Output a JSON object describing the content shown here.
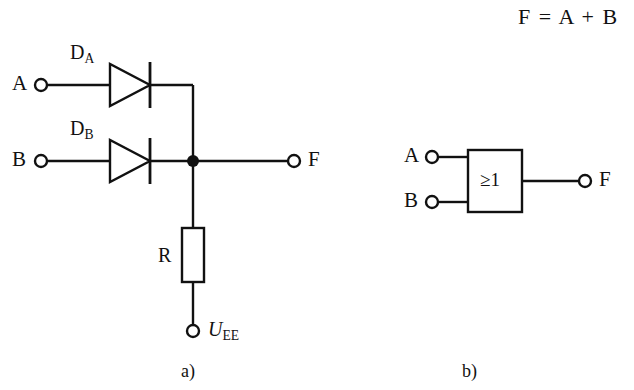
{
  "figure": {
    "equation": "F = A + B",
    "panel_a": {
      "caption": "a)",
      "inputs": [
        {
          "label": "A",
          "terminal": "input-terminal-a"
        },
        {
          "label": "B",
          "terminal": "input-terminal-b"
        }
      ],
      "output": {
        "label": "F",
        "terminal": "output-terminal-f"
      },
      "diodes": [
        {
          "name": "D",
          "subscript": "A"
        },
        {
          "name": "D",
          "subscript": "B"
        }
      ],
      "resistor": {
        "label": "R"
      },
      "supply": {
        "symbol": "U",
        "subscript": "EE"
      },
      "junction": "junction-dot"
    },
    "panel_b": {
      "caption": "b)",
      "gate_symbol": "≥1",
      "inputs": [
        {
          "label": "A",
          "terminal": "gate-input-terminal-a"
        },
        {
          "label": "B",
          "terminal": "gate-input-terminal-b"
        }
      ],
      "output": {
        "label": "F",
        "terminal": "gate-output-terminal-f"
      }
    }
  },
  "style": {
    "background": "#ffffff",
    "ink": "#111111",
    "line_width": 2.4
  }
}
